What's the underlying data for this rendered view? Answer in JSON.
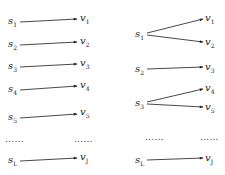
{
  "left_diagram": {
    "title": "one-to-one mapping",
    "sources": [
      {
        "label": "s",
        "sub": "1",
        "x": 8,
        "y": 24
      },
      {
        "label": "s",
        "sub": "2",
        "x": 8,
        "y": 47
      },
      {
        "label": "s",
        "sub": "3",
        "x": 8,
        "y": 69
      },
      {
        "label": "s",
        "sub": "4",
        "x": 8,
        "y": 92
      },
      {
        "label": "s",
        "sub": "5",
        "x": 8,
        "y": 120
      },
      {
        "label": "s",
        "sub": "L",
        "x": 8,
        "y": 163
      }
    ],
    "targets": [
      {
        "label": "v",
        "sub": "1",
        "x": 80,
        "y": 21
      },
      {
        "label": "v",
        "sub": "2",
        "x": 80,
        "y": 44
      },
      {
        "label": "v",
        "sub": "3",
        "x": 80,
        "y": 66
      },
      {
        "label": "v",
        "sub": "4",
        "x": 80,
        "y": 88
      },
      {
        "label": "v",
        "sub": "5",
        "x": 80,
        "y": 115
      },
      {
        "label": "v",
        "sub": "J",
        "x": 80,
        "y": 160
      }
    ],
    "edges": [
      {
        "from": "s1",
        "to": "v1",
        "x1": 20,
        "y1": 22,
        "x2": 77,
        "y2": 19
      },
      {
        "from": "s2",
        "to": "v2",
        "x1": 20,
        "y1": 45,
        "x2": 77,
        "y2": 42
      },
      {
        "from": "s3",
        "to": "v3",
        "x1": 20,
        "y1": 67,
        "x2": 77,
        "y2": 64
      },
      {
        "from": "s4",
        "to": "v4",
        "x1": 20,
        "y1": 90,
        "x2": 77,
        "y2": 86
      },
      {
        "from": "s5",
        "to": "v5",
        "x1": 20,
        "y1": 118,
        "x2": 77,
        "y2": 114
      },
      {
        "from": "sL",
        "to": "vJ",
        "x1": 20,
        "y1": 161,
        "x2": 77,
        "y2": 158
      }
    ],
    "ellipsis": [
      {
        "text": "……",
        "x": 5,
        "y": 142
      },
      {
        "text": "……",
        "x": 74,
        "y": 142
      }
    ]
  },
  "right_diagram": {
    "title": "one-to-many mapping",
    "sources": [
      {
        "label": "s",
        "sub": "1",
        "x": 135,
        "y": 37
      },
      {
        "label": "s",
        "sub": "2",
        "x": 135,
        "y": 72
      },
      {
        "label": "s",
        "sub": "3",
        "x": 135,
        "y": 106
      },
      {
        "label": "s",
        "sub": "L",
        "x": 135,
        "y": 163
      }
    ],
    "targets": [
      {
        "label": "v",
        "sub": "1",
        "x": 205,
        "y": 21
      },
      {
        "label": "v",
        "sub": "2",
        "x": 205,
        "y": 45
      },
      {
        "label": "v",
        "sub": "3",
        "x": 205,
        "y": 70
      },
      {
        "label": "v",
        "sub": "4",
        "x": 205,
        "y": 91
      },
      {
        "label": "v",
        "sub": "5",
        "x": 205,
        "y": 110
      },
      {
        "label": "v",
        "sub": "J",
        "x": 205,
        "y": 161
      }
    ],
    "edges": [
      {
        "from": "s1",
        "to": "v1",
        "x1": 147,
        "y1": 33,
        "x2": 203,
        "y2": 19
      },
      {
        "from": "s1",
        "to": "v2",
        "x1": 147,
        "y1": 35,
        "x2": 203,
        "y2": 42
      },
      {
        "from": "s2",
        "to": "v3",
        "x1": 147,
        "y1": 69,
        "x2": 203,
        "y2": 67
      },
      {
        "from": "s3",
        "to": "v4",
        "x1": 147,
        "y1": 102,
        "x2": 203,
        "y2": 89
      },
      {
        "from": "s3",
        "to": "v5",
        "x1": 147,
        "y1": 104,
        "x2": 203,
        "y2": 107
      },
      {
        "from": "sL",
        "to": "vJ",
        "x1": 147,
        "y1": 160,
        "x2": 203,
        "y2": 158
      }
    ],
    "ellipsis": [
      {
        "text": "……",
        "x": 145,
        "y": 140
      },
      {
        "text": "……",
        "x": 200,
        "y": 140
      }
    ]
  },
  "colors": {
    "edge": "#333333",
    "text": "#222222",
    "background": "#ffffff"
  }
}
